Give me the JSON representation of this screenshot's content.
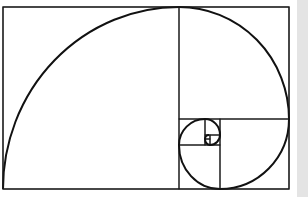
{
  "diagram": {
    "type": "golden-spiral",
    "colors": {
      "background": "#ffffff",
      "stroke": "#1a1a1a",
      "side_strip": "#e4e4e4"
    },
    "outer_rect": {
      "x": 3,
      "y": 7,
      "w": 286,
      "h": 182
    },
    "squares": [
      {
        "x": 3,
        "y": 7,
        "w": 176,
        "h": 182
      },
      {
        "x": 179,
        "y": 7,
        "w": 110,
        "h": 112
      },
      {
        "x": 220,
        "y": 119,
        "w": 69,
        "h": 70
      },
      {
        "x": 179,
        "y": 145,
        "w": 41,
        "h": 44
      },
      {
        "x": 179,
        "y": 119,
        "w": 26,
        "h": 26
      },
      {
        "x": 205,
        "y": 119,
        "w": 15,
        "h": 16
      },
      {
        "x": 210,
        "y": 135,
        "w": 10,
        "h": 10
      },
      {
        "x": 205,
        "y": 139,
        "w": 5,
        "h": 6
      },
      {
        "x": 205,
        "y": 135,
        "w": 5,
        "h": 4
      }
    ]
  }
}
